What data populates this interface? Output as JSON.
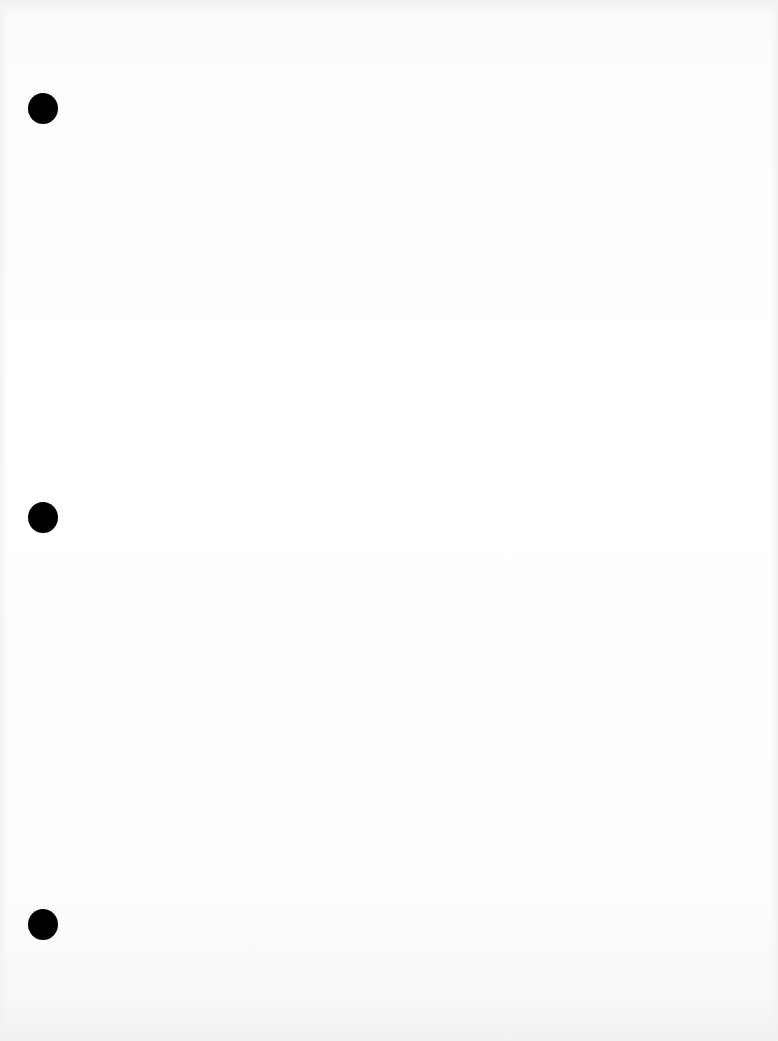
{
  "document": {
    "type": "blank scanned page",
    "background_color": "#ffffff",
    "punch_holes": [
      {
        "x": 43,
        "y": 108,
        "color": "#000000"
      },
      {
        "x": 43,
        "y": 517,
        "color": "#000000"
      },
      {
        "x": 43,
        "y": 924,
        "color": "#000000"
      }
    ]
  }
}
